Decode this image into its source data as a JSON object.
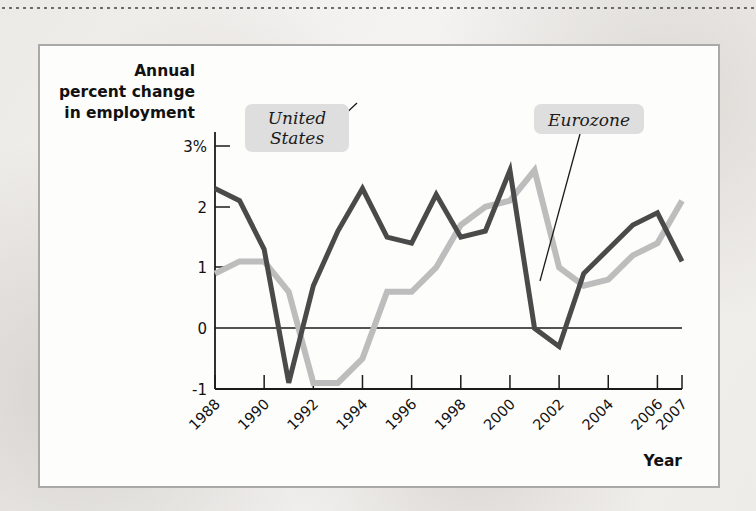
{
  "figure": {
    "y_axis_title_lines": [
      "Annual",
      "percent change",
      "in employment"
    ],
    "x_axis_title": "Year",
    "callouts": [
      {
        "label": "United States",
        "lines": [
          "United",
          "States"
        ]
      },
      {
        "label": "Eurozone",
        "lines": [
          "Eurozone"
        ]
      }
    ],
    "colors": {
      "united_states_line": "#4a4a4a",
      "eurozone_line": "#bdbdbd",
      "axis": "#1b1b1b",
      "callout_background": "#dedede",
      "figure_border": "#a9a9a9",
      "figure_background": "#fdfdfc",
      "page_background": "#f0eeea"
    }
  },
  "chart_data": {
    "type": "line",
    "title": "",
    "subtitle": "",
    "xlabel": "Year",
    "ylabel": "Annual percent change in employment",
    "xlim": [
      1988,
      2007
    ],
    "ylim": [
      -1,
      3
    ],
    "grid": false,
    "legend_position": "inline-callout",
    "x": [
      1988,
      1989,
      1990,
      1991,
      1992,
      1993,
      1994,
      1995,
      1996,
      1997,
      1998,
      1999,
      2000,
      2001,
      2002,
      2003,
      2004,
      2005,
      2006,
      2007
    ],
    "xtick_labels": [
      "1988",
      "1990",
      "1992",
      "1994",
      "1996",
      "1998",
      "2000",
      "2002",
      "2004",
      "2006",
      "2007"
    ],
    "xtick_values": [
      1988,
      1990,
      1992,
      1994,
      1996,
      1998,
      2000,
      2002,
      2004,
      2006,
      2007
    ],
    "ytick_labels": [
      "3%",
      "2",
      "1",
      "0",
      "-1"
    ],
    "ytick_values": [
      3,
      2,
      1,
      0,
      -1
    ],
    "series": [
      {
        "name": "United States",
        "color": "#4a4a4a",
        "values": [
          2.3,
          2.1,
          1.3,
          -0.9,
          0.7,
          1.6,
          2.3,
          1.5,
          1.4,
          2.2,
          1.5,
          1.6,
          2.6,
          0.0,
          -0.3,
          0.9,
          1.3,
          1.7,
          1.9,
          1.1
        ]
      },
      {
        "name": "Eurozone",
        "color": "#bdbdbd",
        "values": [
          0.9,
          1.1,
          1.1,
          0.6,
          -0.9,
          -0.9,
          -0.5,
          0.6,
          0.6,
          1.0,
          1.7,
          2.0,
          2.1,
          2.6,
          1.0,
          0.7,
          0.8,
          1.2,
          1.4,
          2.1
        ]
      }
    ],
    "annotations": [
      {
        "text": "United States",
        "points_to_series": "United States",
        "at_x": 1992.6,
        "at_y": 1.1
      },
      {
        "text": "Eurozone",
        "points_to_series": "Eurozone",
        "at_x": 2001.2,
        "at_y": 0.85
      }
    ]
  }
}
